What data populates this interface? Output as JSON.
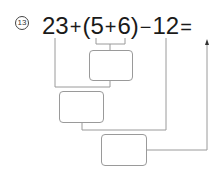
{
  "problem": {
    "number": "13",
    "tokens": [
      "23",
      "+",
      "(",
      "5",
      "+",
      "6",
      ")",
      "−",
      "12",
      "="
    ]
  },
  "answer_boxes": [
    {
      "id": "box-1",
      "value": ""
    },
    {
      "id": "box-2",
      "value": ""
    },
    {
      "id": "box-3",
      "value": ""
    }
  ]
}
